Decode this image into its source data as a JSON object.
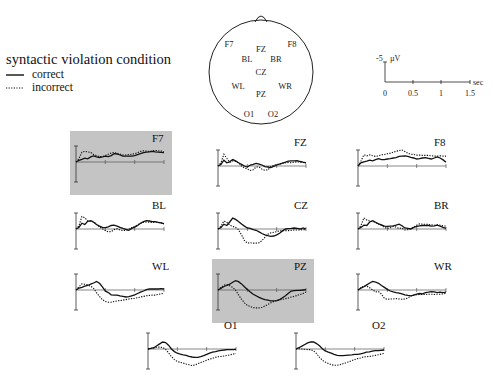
{
  "legend": {
    "title": "syntactic violation condition",
    "correct_label": "correct",
    "incorrect_label": "incorrect"
  },
  "head_map": {
    "electrodes": [
      {
        "name": "F7",
        "x": 229,
        "y": 47
      },
      {
        "name": "FZ",
        "x": 261,
        "y": 52
      },
      {
        "name": "F8",
        "x": 292,
        "y": 47
      },
      {
        "name": "BL",
        "x": 247,
        "y": 62
      },
      {
        "name": "BR",
        "x": 276,
        "y": 62
      },
      {
        "name": "CZ",
        "x": 261,
        "y": 75
      },
      {
        "name": "WL",
        "x": 238,
        "y": 89
      },
      {
        "name": "WR",
        "x": 285,
        "y": 89
      },
      {
        "name": "PZ",
        "x": 261,
        "y": 97
      },
      {
        "name": "O1",
        "x": 249,
        "y": 117
      },
      {
        "name": "O2",
        "x": 273,
        "y": 117
      }
    ]
  },
  "scale_bar": {
    "amplitude_label": "-5",
    "amplitude_unit": "µV",
    "time_unit": "sec",
    "time_ticks": [
      "0",
      "0.5",
      "1",
      "1.5"
    ]
  },
  "colors": {
    "highlight_bg": "#c4c4c4",
    "line": "#111111"
  },
  "chart_data": {
    "type": "line",
    "title": "syntactic violation condition",
    "xlabel": "sec",
    "ylabel": "µV (negative up)",
    "xlim": [
      0,
      1.5
    ],
    "ylim": [
      5,
      -5
    ],
    "x": [
      0,
      0.05,
      0.1,
      0.15,
      0.2,
      0.25,
      0.3,
      0.35,
      0.4,
      0.45,
      0.5,
      0.55,
      0.6,
      0.65,
      0.7,
      0.75,
      0.8,
      0.85,
      0.9,
      0.95,
      1.0,
      1.05,
      1.1,
      1.15,
      1.2,
      1.25,
      1.3,
      1.35,
      1.4,
      1.45,
      1.5
    ],
    "legend": [
      "correct",
      "incorrect"
    ],
    "panels": [
      {
        "name": "F7",
        "highlight": true,
        "x0": 76,
        "y0": 162,
        "label_dx": 82,
        "correct": [
          0,
          -0.5,
          -0.8,
          -1.2,
          -1.0,
          -1.6,
          -1.9,
          -1.6,
          -1.4,
          -1.6,
          -1.8,
          -1.7,
          -2.0,
          -2.6,
          -2.5,
          -2.2,
          -1.8,
          -1.8,
          -1.8,
          -1.8,
          -2.0,
          -2.3,
          -2.6,
          -2.9,
          -3.1,
          -3.2,
          -3.3,
          -3.2,
          -3.1,
          -3.0,
          -2.9
        ],
        "incorrect": [
          0,
          -1.0,
          -3.1,
          -3.3,
          -3.2,
          -3.0,
          -2.3,
          -2.0,
          -1.7,
          -1.7,
          -2.0,
          -2.4,
          -2.8,
          -3.0,
          -2.7,
          -2.5,
          -2.2,
          -2.2,
          -2.3,
          -2.4,
          -2.6,
          -2.9,
          -3.3,
          -3.5,
          -3.4,
          -3.3,
          -3.5,
          -3.6,
          -3.5,
          -3.4,
          -3.2
        ]
      },
      {
        "name": "FZ",
        "highlight": false,
        "x0": 218,
        "y0": 166,
        "label_dx": 82,
        "correct": [
          0,
          -0.5,
          -1.8,
          -1.0,
          -1.3,
          -2.0,
          -1.6,
          -1.0,
          -0.5,
          0.0,
          0.3,
          -0.3,
          -0.5,
          -0.8,
          -0.6,
          -0.3,
          0.2,
          0.3,
          0.5,
          0.1,
          -0.3,
          -0.6,
          -0.9,
          -1.2,
          -1.5,
          -1.6,
          -1.6,
          -1.7,
          -1.4,
          -1.2,
          -1.0
        ],
        "incorrect": [
          0,
          -1.0,
          -3.7,
          -2.4,
          -1.2,
          -1.6,
          -1.5,
          -1.0,
          0.0,
          0.6,
          0.9,
          1.4,
          1.2,
          0.3,
          0.3,
          1.0,
          1.3,
          1.2,
          0.2,
          -0.2,
          -0.5,
          -0.6,
          -0.8,
          -1.0,
          -1.1,
          -1.0,
          -1.2,
          -1.3,
          -1.2,
          -1.1,
          -0.9
        ]
      },
      {
        "name": "F8",
        "highlight": false,
        "x0": 358,
        "y0": 166,
        "label_dx": 82,
        "correct": [
          0,
          -1.0,
          -1.3,
          -1.5,
          -1.8,
          -1.6,
          -2.0,
          -2.3,
          -2.0,
          -2.0,
          -2.2,
          -2.3,
          -2.5,
          -2.6,
          -3.0,
          -3.1,
          -3.2,
          -3.0,
          -2.7,
          -2.5,
          -2.2,
          -2.3,
          -2.5,
          -2.6,
          -2.4,
          -2.2,
          -2.5,
          -2.8,
          -2.5,
          -1.9,
          -1.2
        ],
        "incorrect": [
          0,
          -1.5,
          -3.5,
          -3.2,
          -3.5,
          -3.2,
          -3.0,
          -3.2,
          -3.5,
          -3.6,
          -3.8,
          -4.0,
          -4.3,
          -4.6,
          -4.8,
          -5.0,
          -4.5,
          -4.0,
          -3.7,
          -3.6,
          -3.4,
          -3.4,
          -3.3,
          -3.3,
          -3.3,
          -3.2,
          -3.1,
          -3.1,
          -3.2,
          -3.1,
          -3.1
        ]
      },
      {
        "name": "BL",
        "highlight": false,
        "x0": 76,
        "y0": 229,
        "label_dx": 82,
        "correct": [
          0,
          -0.5,
          -1.8,
          -1.4,
          -2.4,
          -2.6,
          -2.1,
          -1.4,
          -0.9,
          -0.5,
          -0.4,
          -0.7,
          -1.1,
          -1.2,
          -0.9,
          -0.5,
          -0.2,
          0.1,
          0.4,
          -0.2,
          -0.6,
          -1.1,
          -1.8,
          -2.3,
          -2.6,
          -2.5,
          -2.3,
          -2.3,
          -2.1,
          -1.9,
          -1.7
        ],
        "incorrect": [
          0,
          -1.0,
          -3.9,
          -3.5,
          -2.5,
          -2.4,
          -2.4,
          -1.4,
          -0.7,
          -0.1,
          0.5,
          0.9,
          0.8,
          0.2,
          -0.1,
          0.3,
          0.5,
          0.4,
          0.1,
          -0.4,
          -0.8,
          -1.3,
          -1.7,
          -2.1,
          -2.2,
          -2.1,
          -2.0,
          -2.1,
          -2.1,
          -1.9,
          -1.6
        ]
      },
      {
        "name": "CZ",
        "highlight": false,
        "x0": 218,
        "y0": 229,
        "label_dx": 82,
        "correct": [
          0,
          -0.4,
          -1.5,
          -1.1,
          -2.2,
          -3.4,
          -3.0,
          -2.3,
          -1.6,
          -0.9,
          -0.3,
          -0.2,
          0.2,
          0.4,
          0.9,
          1.4,
          1.8,
          2.1,
          2.3,
          2.2,
          1.8,
          1.3,
          0.6,
          0.0,
          -0.1,
          -0.2,
          -0.3,
          -0.2,
          0.0,
          -0.3,
          0.0
        ],
        "incorrect": [
          0,
          -0.8,
          -2.5,
          -2.1,
          -1.2,
          -0.8,
          -0.5,
          0.2,
          1.8,
          3.6,
          4.4,
          4.3,
          4.4,
          4.4,
          4.3,
          3.6,
          2.6,
          1.6,
          1.2,
          1.0,
          0.8,
          0.6,
          0.5,
          0.5,
          0.5,
          0.4,
          0.3,
          0.3,
          0.3,
          0.2,
          0.2
        ]
      },
      {
        "name": "BR",
        "highlight": false,
        "x0": 358,
        "y0": 229,
        "label_dx": 82,
        "correct": [
          0,
          -0.5,
          -1.2,
          -1.1,
          -2.2,
          -2.6,
          -2.1,
          -1.6,
          -1.3,
          -0.9,
          -0.8,
          -0.9,
          -1.0,
          -1.2,
          -1.5,
          -1.0,
          -0.3,
          -0.2,
          0.0,
          -0.5,
          -0.8,
          -1.0,
          -1.1,
          -1.1,
          -1.1,
          -0.9,
          -1.0,
          -1.2,
          -0.9,
          -0.5,
          -0.2
        ],
        "incorrect": [
          0,
          -1.0,
          -3.5,
          -2.8,
          -2.5,
          -2.3,
          -2.0,
          -1.6,
          -1.1,
          -0.5,
          -0.2,
          -0.4,
          -0.8,
          -0.6,
          -0.2,
          -0.3,
          0.3,
          0.2,
          -0.2,
          -0.6,
          -1.2,
          -1.6,
          -1.5,
          -1.5,
          -1.4,
          -1.3,
          -1.2,
          -1.3,
          -1.2,
          -1.0,
          -0.9
        ]
      },
      {
        "name": "WL",
        "highlight": false,
        "x0": 76,
        "y0": 290,
        "label_dx": 82,
        "correct": [
          0,
          -0.6,
          -0.8,
          -1.2,
          -1.4,
          -1.8,
          -2.2,
          -2.7,
          -2.1,
          -1.0,
          0.3,
          0.8,
          1.5,
          1.6,
          1.6,
          1.8,
          2.0,
          2.2,
          2.1,
          1.8,
          1.5,
          1.1,
          0.7,
          0.3,
          -0.1,
          -0.3,
          -0.3,
          -0.3,
          -0.3,
          -0.4,
          -0.3
        ],
        "incorrect": [
          0,
          -1.0,
          -1.9,
          -1.8,
          -1.6,
          -1.2,
          -0.5,
          0.8,
          2.0,
          3.0,
          3.6,
          3.8,
          3.8,
          3.6,
          3.4,
          3.3,
          3.2,
          3.0,
          2.8,
          2.7,
          2.6,
          2.4,
          2.2,
          2.0,
          1.8,
          1.7,
          1.6,
          1.6,
          1.4,
          1.2,
          1.0
        ]
      },
      {
        "name": "PZ",
        "highlight": true,
        "x0": 218,
        "y0": 290,
        "label_dx": 82,
        "correct": [
          0,
          -0.5,
          -1.1,
          -1.4,
          -1.8,
          -2.4,
          -2.9,
          -2.6,
          -1.9,
          -1.0,
          -0.2,
          0.6,
          1.3,
          1.8,
          2.3,
          2.7,
          3.0,
          3.2,
          3.4,
          3.4,
          3.3,
          3.0,
          2.4,
          1.8,
          1.0,
          0.3,
          0.2,
          0.1,
          0.1,
          0.0,
          -0.1
        ],
        "incorrect": [
          0,
          -0.8,
          -1.5,
          -1.7,
          -1.3,
          -0.8,
          0.1,
          1.5,
          2.9,
          4.0,
          4.8,
          5.2,
          5.5,
          5.6,
          5.6,
          5.4,
          5.0,
          4.5,
          4.0,
          3.6,
          3.3,
          3.1,
          2.9,
          2.7,
          2.5,
          2.2,
          2.0,
          1.7,
          1.4,
          1.1,
          0.7
        ]
      },
      {
        "name": "WR",
        "highlight": false,
        "x0": 358,
        "y0": 290,
        "label_dx": 82,
        "correct": [
          0,
          -0.6,
          -1.0,
          -1.6,
          -2.2,
          -2.7,
          -2.5,
          -2.1,
          -1.4,
          -0.8,
          -0.2,
          0.3,
          0.6,
          0.8,
          1.0,
          1.2,
          1.5,
          1.7,
          1.8,
          1.6,
          1.3,
          1.1,
          1.2,
          0.8,
          0.7,
          0.5,
          0.6,
          0.8,
          0.7,
          0.8,
          0.7
        ],
        "incorrect": [
          0,
          -0.7,
          -1.3,
          -1.2,
          -0.7,
          0.0,
          0.6,
          0.5,
          1.3,
          2.6,
          2.9,
          2.8,
          2.8,
          2.7,
          2.8,
          2.9,
          2.8,
          2.5,
          1.9,
          1.6,
          1.5,
          1.4,
          1.4,
          1.4,
          1.3,
          1.3,
          1.4,
          1.3,
          1.3,
          1.2,
          1.1
        ]
      },
      {
        "name": "O1",
        "highlight": false,
        "x0": 148,
        "y0": 349,
        "label_dx": 82,
        "correct": [
          0,
          -0.2,
          -0.4,
          -1.0,
          -1.6,
          -2.2,
          -2.0,
          -1.2,
          0.0,
          0.8,
          1.3,
          1.6,
          1.8,
          2.0,
          2.3,
          2.5,
          2.6,
          2.6,
          2.4,
          2.1,
          1.7,
          1.3,
          1.0,
          0.8,
          0.6,
          0.4,
          0.3,
          0.2,
          0.2,
          0.2,
          0.1
        ],
        "incorrect": [
          0,
          -0.2,
          -0.3,
          -0.6,
          -0.6,
          -0.5,
          0.1,
          1.2,
          2.4,
          3.3,
          3.9,
          4.2,
          4.4,
          4.7,
          4.9,
          5.2,
          5.0,
          4.6,
          4.2,
          3.9,
          3.5,
          3.2,
          2.9,
          2.6,
          2.4,
          2.3,
          2.2,
          2.0,
          1.8,
          1.6,
          1.4
        ]
      },
      {
        "name": "O2",
        "highlight": false,
        "x0": 296,
        "y0": 349,
        "label_dx": 82,
        "correct": [
          0,
          -0.4,
          -0.9,
          -1.4,
          -1.9,
          -2.2,
          -2.2,
          -1.7,
          -1.0,
          -0.1,
          0.6,
          1.0,
          1.3,
          1.7,
          2.0,
          2.1,
          2.1,
          2.0,
          1.9,
          1.8,
          1.7,
          1.7,
          1.5,
          1.3,
          1.0,
          0.9,
          0.7,
          0.5,
          0.5,
          0.4,
          0.3
        ],
        "incorrect": [
          0,
          -0.1,
          0.0,
          0.1,
          0.2,
          0.2,
          0.6,
          1.4,
          2.6,
          3.5,
          4.1,
          4.5,
          4.9,
          5.1,
          5.1,
          4.9,
          4.6,
          4.3,
          4.0,
          3.6,
          3.3,
          3.0,
          2.8,
          2.5,
          2.4,
          2.3,
          2.2,
          2.0,
          1.8,
          1.6,
          1.4
        ]
      }
    ]
  }
}
